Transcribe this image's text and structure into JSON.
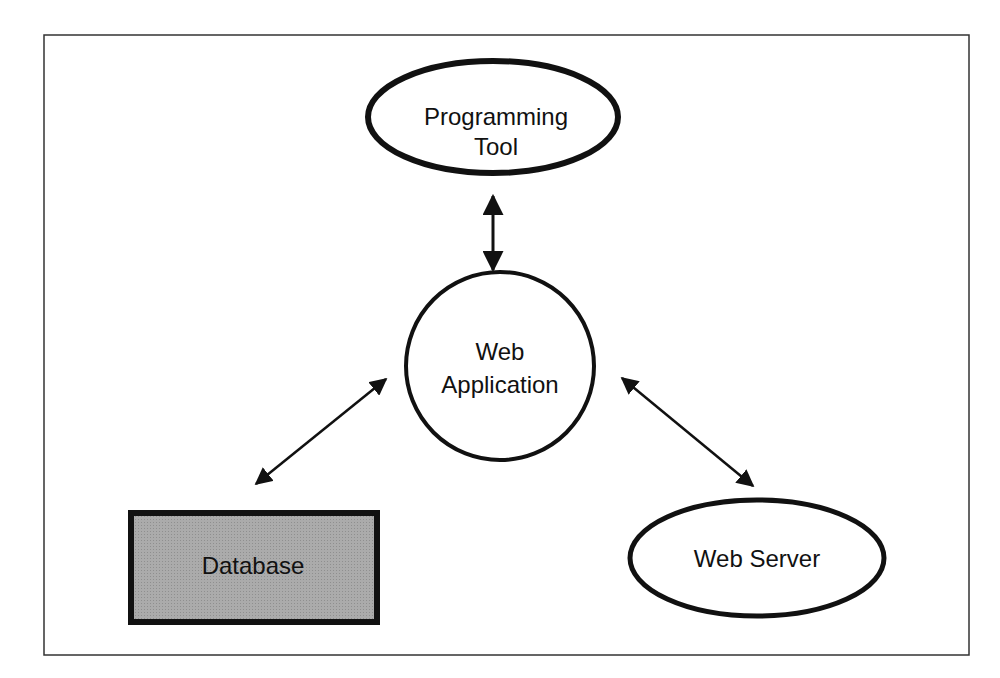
{
  "diagram": {
    "nodes": [
      {
        "id": "programming-tool",
        "lines": [
          "Programming",
          "Tool"
        ],
        "shape": "ellipse"
      },
      {
        "id": "web-application",
        "lines": [
          "Web",
          "Application"
        ],
        "shape": "circle"
      },
      {
        "id": "database",
        "lines": [
          "Database"
        ],
        "shape": "rectangle",
        "fill": "#a9a9a9"
      },
      {
        "id": "web-server",
        "lines": [
          "Web Server"
        ],
        "shape": "ellipse"
      }
    ],
    "edges": [
      {
        "from": "programming-tool",
        "to": "web-application",
        "direction": "bidirectional"
      },
      {
        "from": "web-application",
        "to": "database",
        "direction": "bidirectional"
      },
      {
        "from": "web-application",
        "to": "web-server",
        "direction": "bidirectional"
      }
    ],
    "colors": {
      "stroke": "#111111",
      "database_fill": "#a9a9a9",
      "background": "#ffffff"
    }
  }
}
